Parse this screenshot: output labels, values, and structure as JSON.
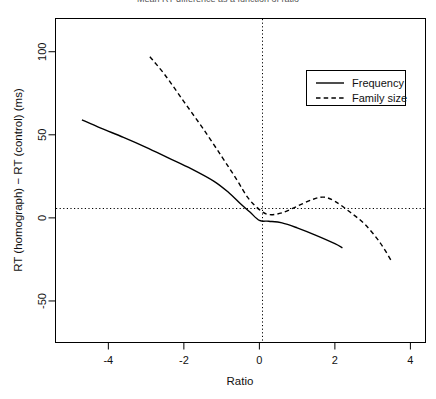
{
  "chart_data": {
    "type": "line",
    "title": "Mean RT difference as a function of ratio",
    "xlabel": "Ratio",
    "ylabel": "RT (homograph) − RT (control) (ms)",
    "xlim": [
      -5.4,
      4.4
    ],
    "ylim": [
      -75,
      120
    ],
    "xticks": [
      -4,
      -2,
      0,
      2,
      4
    ],
    "xtick_labels": [
      "-4",
      "-2",
      "0",
      "2",
      "4"
    ],
    "yticks": [
      -50,
      0,
      50,
      100
    ],
    "ytick_labels": [
      "-50",
      "0",
      "50",
      "100"
    ],
    "grid": false,
    "reference_lines": [
      {
        "axis": "y",
        "value": 0,
        "style": "dotted"
      },
      {
        "axis": "x",
        "value": 0,
        "style": "dotted"
      }
    ],
    "legend_position": "top-right",
    "series": [
      {
        "name": "Frequency",
        "style": "solid",
        "color": "#000000",
        "x": [
          -4.7,
          -4.2,
          -3.6,
          -3.0,
          -2.4,
          -1.8,
          -1.2,
          -0.8,
          -0.5,
          -0.25,
          0.0,
          0.25,
          0.6,
          1.0,
          1.5,
          2.0,
          2.2
        ],
        "y": [
          59.0,
          54.0,
          48.5,
          42.5,
          36.0,
          29.5,
          22.0,
          15.0,
          8.5,
          3.5,
          -1.5,
          -2.0,
          -3.0,
          -6.0,
          -10.5,
          -15.5,
          -18.0
        ]
      },
      {
        "name": "Family size",
        "style": "dashed",
        "color": "#000000",
        "x": [
          -2.9,
          -2.5,
          -2.0,
          -1.5,
          -1.0,
          -0.6,
          -0.3,
          0.0,
          0.25,
          0.6,
          1.0,
          1.4,
          1.7,
          2.0,
          2.4,
          2.8,
          3.2,
          3.5
        ],
        "y": [
          97.0,
          86.0,
          70.0,
          54.0,
          37.0,
          23.0,
          12.0,
          5.0,
          2.0,
          3.0,
          7.0,
          11.0,
          12.5,
          10.0,
          3.5,
          -4.0,
          -15.0,
          -26.0
        ]
      }
    ]
  },
  "legend": {
    "entries": [
      {
        "label": "Frequency",
        "style": "solid"
      },
      {
        "label": "Family size",
        "style": "dashed"
      }
    ]
  }
}
